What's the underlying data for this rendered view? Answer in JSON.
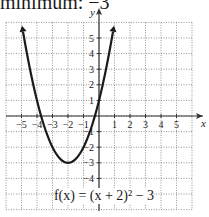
{
  "caption": "minimum: −3",
  "chart_data": {
    "type": "line",
    "title": "",
    "equation": "f(x) = (x + 2)² − 3",
    "xlabel": "x",
    "ylabel": "y",
    "xlim": [
      -6,
      6
    ],
    "ylim": [
      -6,
      6
    ],
    "grid": true,
    "x_ticks": [
      -5,
      -4,
      -3,
      -2,
      -1,
      1,
      2,
      3,
      4,
      5
    ],
    "y_ticks": [
      5,
      4,
      3,
      2,
      1,
      -1,
      -2,
      -3,
      -4
    ],
    "x_tick_labels": [
      "−5",
      "−4",
      "−3",
      "−2",
      "−1",
      "1",
      "2",
      "3",
      "4",
      "5"
    ],
    "y_tick_labels": [
      "5",
      "4",
      "3",
      "2",
      "1",
      "−1",
      "−2",
      "−3",
      "−4"
    ],
    "series": [
      {
        "name": "f(x) = (x + 2)² − 3",
        "vertex": [
          -2,
          -3
        ],
        "x": [
          -4.9,
          -4.5,
          -4,
          -3.5,
          -3,
          -2.5,
          -2,
          -1.5,
          -1,
          -0.5,
          0,
          0.5,
          0.9
        ],
        "y": [
          5.41,
          3.25,
          1,
          -0.75,
          -2,
          -2.75,
          -3,
          -2.75,
          -2,
          -0.75,
          1,
          3.25,
          5.41
        ]
      }
    ]
  }
}
